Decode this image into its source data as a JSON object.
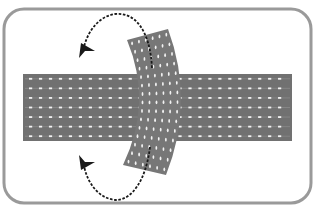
{
  "diagram": {
    "title": "Twisted strip crossing a band with rotation arrows",
    "colors": {
      "background": "#ffffff",
      "frame": "#9a9a9a",
      "band": "#717171",
      "band_dash": "#ffffff",
      "strip": "#777777",
      "arrow": "#1a1a1a"
    },
    "frame": {
      "x": 4,
      "y": 9,
      "width": 307,
      "height": 194,
      "radius": 20,
      "stroke_width": 3
    },
    "band": {
      "x": 23,
      "y": 74,
      "width": 269,
      "height": 67,
      "dash_rows": 7,
      "dash_cols": 26
    },
    "strip": {
      "top_left": [
        127,
        40
      ],
      "top_right": [
        168,
        29
      ],
      "bottom_left": [
        123,
        165
      ],
      "bottom_right": [
        166,
        175
      ],
      "bow": "right",
      "dot_cols": 6,
      "dot_rows": 15
    },
    "arrows": [
      {
        "name": "upper-rotation-arrow",
        "path": "M152,68 C150,30 135,12 115,14 C100,16 88,30 84,47",
        "head": [
          82,
          55
        ],
        "direction": "counterclockwise"
      },
      {
        "name": "lower-rotation-arrow",
        "path": "M150,147 C146,180 132,200 116,200 C100,199 88,185 84,166",
        "head": [
          82,
          158
        ],
        "direction": "clockwise"
      }
    ]
  }
}
